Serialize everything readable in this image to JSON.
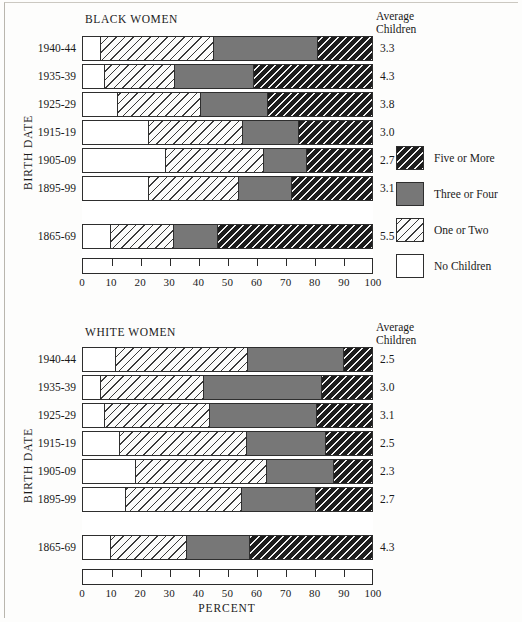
{
  "figure": {
    "x_axis_title": "PERCENT",
    "y_axis_title": "BIRTH  DATE",
    "average_header_line1": "Average",
    "average_header_line2": "Children",
    "tick_labels": [
      "0",
      "10",
      "20",
      "30",
      "40",
      "50",
      "60",
      "70",
      "80",
      "90",
      "100"
    ]
  },
  "legend": {
    "items": [
      {
        "label": "Five or More",
        "swatch": "black-hatched-swatch",
        "color": "#1d1d1d"
      },
      {
        "label": "Three or Four",
        "swatch": "gray-solid-swatch",
        "color": "#777777"
      },
      {
        "label": "One or Two",
        "swatch": "light-hatched-swatch",
        "color": "#fbfbfa"
      },
      {
        "label": "No Children",
        "swatch": "white-swatch",
        "color": "#ffffff"
      }
    ]
  },
  "chart_data": [
    {
      "type": "bar",
      "title": "BLACK WOMEN",
      "orientation": "horizontal",
      "stacked": true,
      "xlabel": "PERCENT",
      "ylabel": "BIRTH DATE",
      "xlim": [
        0,
        100
      ],
      "grid": false,
      "legend_position": "right",
      "categories": [
        "1940-44",
        "1935-39",
        "1925-29",
        "1915-19",
        "1905-09",
        "1895-99",
        "1865-69"
      ],
      "series": [
        {
          "name": "No Children",
          "values": [
            6.4,
            7.8,
            12.4,
            23.0,
            29.0,
            23.0,
            10.0
          ]
        },
        {
          "name": "One or Two",
          "values": [
            39.1,
            24.2,
            28.6,
            32.5,
            33.5,
            31.0,
            21.7
          ]
        },
        {
          "name": "Three or Four",
          "values": [
            35.5,
            27.0,
            23.0,
            19.0,
            14.8,
            18.0,
            15.0
          ]
        },
        {
          "name": "Five or More",
          "values": [
            19.0,
            41.0,
            36.0,
            25.5,
            22.7,
            28.0,
            53.3
          ]
        }
      ],
      "annotations": {
        "average_children": [
          "3.3",
          "4.3",
          "3.8",
          "3.0",
          "2.7",
          "3.1",
          "5.5"
        ]
      }
    },
    {
      "type": "bar",
      "title": "WHITE WOMEN",
      "orientation": "horizontal",
      "stacked": true,
      "xlabel": "PERCENT",
      "ylabel": "BIRTH DATE",
      "xlim": [
        0,
        100
      ],
      "grid": false,
      "legend_position": "right",
      "categories": [
        "1940-44",
        "1935-39",
        "1925-29",
        "1915-19",
        "1905-09",
        "1895-99",
        "1865-69"
      ],
      "series": [
        {
          "name": "No Children",
          "values": [
            11.8,
            6.7,
            7.8,
            13.0,
            18.4,
            15.0,
            10.0
          ]
        },
        {
          "name": "One or Two",
          "values": [
            45.2,
            35.3,
            36.2,
            43.7,
            45.1,
            40.0,
            26.0
          ]
        },
        {
          "name": "Three or Four",
          "values": [
            33.0,
            40.5,
            36.8,
            27.0,
            23.0,
            25.4,
            21.6
          ]
        },
        {
          "name": "Five or More",
          "values": [
            10.0,
            17.5,
            19.2,
            16.3,
            13.5,
            19.6,
            42.4
          ]
        }
      ],
      "annotations": {
        "average_children": [
          "2.5",
          "3.0",
          "3.1",
          "2.5",
          "2.3",
          "2.7",
          "4.3"
        ]
      }
    }
  ]
}
